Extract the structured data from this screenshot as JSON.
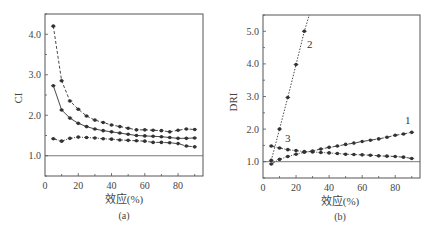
{
  "chart_data": [
    {
      "type": "line",
      "panel": "(a)",
      "title": "",
      "xlabel": "效应(%)",
      "ylabel": "CI",
      "caption": "(a)",
      "xlim": [
        0,
        95
      ],
      "ylim": [
        0.5,
        4.5
      ],
      "xticks": [
        0,
        20,
        40,
        60,
        80
      ],
      "xtick_labels": [
        "0",
        "20",
        "40",
        "60",
        "80"
      ],
      "yticks": [
        1.0,
        2.0,
        3.0,
        4.0
      ],
      "ytick_labels": [
        "1.0",
        "2.0",
        "3.0",
        "4.0"
      ],
      "reference_line": 1.0,
      "grid": false,
      "x": [
        5,
        10,
        15,
        20,
        25,
        30,
        35,
        40,
        45,
        50,
        55,
        60,
        65,
        70,
        75,
        80,
        85,
        90
      ],
      "series": [
        {
          "name": "upper (dashed)",
          "style": "dashed",
          "values": [
            4.2,
            2.85,
            2.35,
            2.15,
            1.98,
            1.88,
            1.82,
            1.76,
            1.72,
            1.68,
            1.64,
            1.64,
            1.63,
            1.62,
            1.59,
            1.63,
            1.66,
            1.65
          ]
        },
        {
          "name": "middle (solid)",
          "style": "solid",
          "values": [
            2.73,
            2.13,
            1.93,
            1.8,
            1.72,
            1.66,
            1.62,
            1.59,
            1.56,
            1.53,
            1.5,
            1.49,
            1.48,
            1.47,
            1.45,
            1.43,
            1.43,
            1.44
          ]
        },
        {
          "name": "lower (dash-dot)",
          "style": "dashdot",
          "values": [
            1.42,
            1.36,
            1.43,
            1.46,
            1.45,
            1.44,
            1.42,
            1.41,
            1.39,
            1.38,
            1.37,
            1.36,
            1.33,
            1.33,
            1.32,
            1.3,
            1.24,
            1.22
          ]
        }
      ]
    },
    {
      "type": "line",
      "panel": "(b)",
      "title": "",
      "xlabel": "效应(%)",
      "ylabel": "DRI",
      "caption": "(b)",
      "xlim": [
        0,
        95
      ],
      "ylim": [
        0.5,
        5.5
      ],
      "xticks": [
        0,
        20,
        40,
        60,
        80
      ],
      "xtick_labels": [
        "0",
        "20",
        "40",
        "60",
        "80"
      ],
      "yticks": [
        1.0,
        2.0,
        3.0,
        4.0,
        5.0
      ],
      "ytick_labels": [
        "1.0",
        "2.0",
        "3.0",
        "4.0",
        "5.0"
      ],
      "reference_line": 1.0,
      "grid": false,
      "annotations": [
        "1",
        "2",
        "3"
      ],
      "series": [
        {
          "name": "1",
          "style": "dashdot",
          "x": [
            5,
            10,
            15,
            20,
            25,
            30,
            35,
            40,
            45,
            50,
            55,
            60,
            65,
            70,
            75,
            80,
            85,
            90
          ],
          "values": [
            0.93,
            1.07,
            1.16,
            1.23,
            1.29,
            1.33,
            1.39,
            1.44,
            1.48,
            1.53,
            1.57,
            1.62,
            1.66,
            1.7,
            1.75,
            1.81,
            1.85,
            1.9
          ]
        },
        {
          "name": "2",
          "style": "dotted",
          "x": [
            5,
            10,
            15,
            20,
            25
          ],
          "values": [
            1.04,
            2.0,
            2.97,
            3.98,
            5.0
          ],
          "extends_to": {
            "x": 28,
            "y": 5.5
          }
        },
        {
          "name": "3",
          "style": "dashdot",
          "x": [
            5,
            10,
            15,
            20,
            25,
            30,
            35,
            40,
            45,
            50,
            55,
            60,
            65,
            70,
            75,
            80,
            85,
            90
          ],
          "values": [
            1.48,
            1.42,
            1.37,
            1.34,
            1.31,
            1.3,
            1.28,
            1.27,
            1.25,
            1.23,
            1.22,
            1.21,
            1.2,
            1.18,
            1.17,
            1.16,
            1.14,
            1.1
          ]
        }
      ]
    }
  ],
  "panels": {
    "a": {
      "ylabel": "CI",
      "xlabel": "效应(%)",
      "caption": "(a)"
    },
    "b": {
      "ylabel": "DRI",
      "xlabel": "效应(%)",
      "caption": "(b)",
      "label_1": "1",
      "label_2": "2",
      "label_3": "3"
    }
  },
  "colors": {
    "line": "#333333",
    "frame": "#555555",
    "text": "#444444"
  }
}
